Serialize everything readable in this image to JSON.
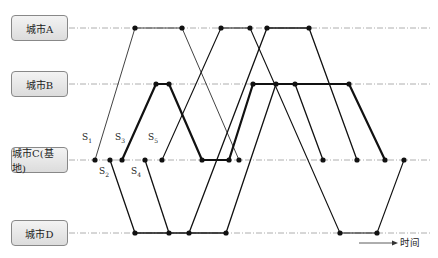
{
  "cities": [
    {
      "label": "城市A",
      "y": 28
    },
    {
      "label": "城市B",
      "y": 84
    },
    {
      "label": "城市C(基地)",
      "y": 160
    },
    {
      "label": "城市D",
      "y": 233
    }
  ],
  "series_labels": [
    {
      "label": "S",
      "sub": "1",
      "x": 82,
      "y": 139
    },
    {
      "label": "S",
      "sub": "2",
      "x": 99,
      "y": 166
    },
    {
      "label": "S",
      "sub": "3",
      "x": 115,
      "y": 139
    },
    {
      "label": "S",
      "sub": "4",
      "x": 131,
      "y": 166
    },
    {
      "label": "S",
      "sub": "5",
      "x": 148,
      "y": 139
    }
  ],
  "legend": {
    "time_label": "时间"
  }
}
